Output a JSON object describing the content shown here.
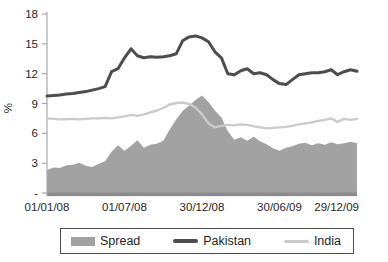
{
  "figure": {
    "ylabel": "%",
    "colors": {
      "spread_fill": "#a2a2a2",
      "pakistan_line": "#4d4d4d",
      "india_line": "#cbcbcb",
      "baseline": "#8c8c8c",
      "axis": "#a9a9a9",
      "text": "#262626"
    }
  },
  "legend": {
    "items": [
      {
        "label": "Spread",
        "type": "area",
        "color": "#a2a2a2"
      },
      {
        "label": "Pakistan",
        "type": "line",
        "color": "#4d4d4d"
      },
      {
        "label": "India",
        "type": "line",
        "color": "#cbcbcb"
      }
    ]
  },
  "chart_data": {
    "type": "area+line combo",
    "title": "",
    "xlabel": "",
    "ylabel": "%",
    "ylim": [
      0,
      18
    ],
    "yticks": [
      0,
      3,
      6,
      9,
      12,
      15,
      18
    ],
    "ytick_labels": [
      "-",
      "3",
      "6",
      "9",
      "12",
      "15",
      "18"
    ],
    "x_unit": "months since 01/01/08",
    "xlim": [
      0,
      24
    ],
    "xticks": [
      0,
      6,
      12,
      18,
      24
    ],
    "xtick_labels": [
      "01/01/08",
      "01/07/08",
      "30/12/08",
      "30/06/09",
      "29/12/09"
    ],
    "grid": false,
    "legend_position": "bottom",
    "x": [
      0,
      0.5,
      1,
      1.5,
      2,
      2.5,
      3,
      3.5,
      4,
      4.5,
      5,
      5.5,
      6,
      6.5,
      7,
      7.5,
      8,
      8.5,
      9,
      9.5,
      10,
      10.5,
      11,
      11.5,
      12,
      12.5,
      13,
      13.5,
      14,
      14.5,
      15,
      15.5,
      16,
      16.5,
      17,
      17.5,
      18,
      18.5,
      19,
      19.5,
      20,
      20.5,
      21,
      21.5,
      22,
      22.5,
      23,
      23.5,
      24
    ],
    "series": [
      {
        "name": "Spread",
        "type": "area",
        "color": "#a2a2a2",
        "values": [
          2.3,
          2.55,
          2.5,
          2.8,
          2.85,
          3.05,
          2.75,
          2.6,
          2.95,
          3.2,
          4.15,
          4.8,
          4.25,
          4.75,
          5.3,
          4.55,
          4.85,
          4.95,
          5.25,
          6.4,
          7.4,
          8.25,
          8.8,
          9.35,
          9.8,
          9.15,
          8.3,
          7.6,
          6.2,
          5.35,
          5.6,
          5.25,
          5.65,
          5.2,
          4.9,
          4.5,
          4.25,
          4.55,
          4.7,
          4.95,
          5.05,
          4.8,
          5.0,
          4.85,
          5.1,
          4.9,
          5.0,
          5.15,
          5.0
        ]
      },
      {
        "name": "Pakistan",
        "type": "line",
        "color": "#4d4d4d",
        "values": [
          9.75,
          9.8,
          9.85,
          9.95,
          10.0,
          10.1,
          10.2,
          10.35,
          10.5,
          10.7,
          12.2,
          12.5,
          13.6,
          14.5,
          13.8,
          13.6,
          13.7,
          13.65,
          13.7,
          13.8,
          14.0,
          15.3,
          15.7,
          15.8,
          15.6,
          15.2,
          14.2,
          13.6,
          12.0,
          11.9,
          12.3,
          12.5,
          12.0,
          12.1,
          11.9,
          11.4,
          11.0,
          10.9,
          11.4,
          11.9,
          12.0,
          12.1,
          12.1,
          12.2,
          12.4,
          11.9,
          12.2,
          12.4,
          12.25
        ]
      },
      {
        "name": "India",
        "type": "line",
        "color": "#cbcbcb",
        "values": [
          7.5,
          7.45,
          7.4,
          7.42,
          7.45,
          7.4,
          7.45,
          7.5,
          7.5,
          7.55,
          7.5,
          7.6,
          7.7,
          7.85,
          7.75,
          7.9,
          8.1,
          8.3,
          8.55,
          8.9,
          9.05,
          9.1,
          8.95,
          8.6,
          7.9,
          7.0,
          6.6,
          6.75,
          6.85,
          6.8,
          6.9,
          6.85,
          6.7,
          6.6,
          6.5,
          6.55,
          6.6,
          6.65,
          6.75,
          6.9,
          7.0,
          7.1,
          7.25,
          7.35,
          7.5,
          7.15,
          7.45,
          7.35,
          7.45
        ]
      }
    ]
  }
}
